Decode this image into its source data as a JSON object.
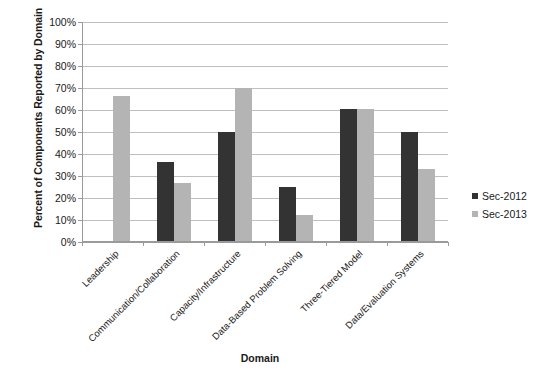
{
  "chart_data": {
    "type": "bar",
    "title": "",
    "xlabel": "Domain",
    "ylabel": "Percent of Components Reported by Domain",
    "categories": [
      "Leadership",
      "Communication/Collaboration",
      "Capacity/Infrastructure",
      "Data-Based Problem Solving",
      "Three-Tiered Model",
      "Data/Evaluation Systems"
    ],
    "series": [
      {
        "name": "Sec-2012",
        "color": "#333333",
        "values": [
          0,
          36.5,
          50,
          25,
          60.5,
          50
        ]
      },
      {
        "name": "Sec-2013",
        "color": "#b4b4b4",
        "values": [
          66.5,
          27,
          70,
          12.5,
          60.5,
          33
        ]
      }
    ],
    "ylim": [
      0,
      100
    ],
    "y_ticks": [
      0,
      10,
      20,
      30,
      40,
      50,
      60,
      70,
      80,
      90,
      100
    ],
    "y_tick_labels": [
      "0%",
      "10%",
      "20%",
      "30%",
      "40%",
      "50%",
      "60%",
      "70%",
      "80%",
      "90%",
      "100%"
    ],
    "grid": true,
    "legend_position": "right",
    "legend_entries": [
      "Sec-2012",
      "Sec-2013"
    ]
  }
}
